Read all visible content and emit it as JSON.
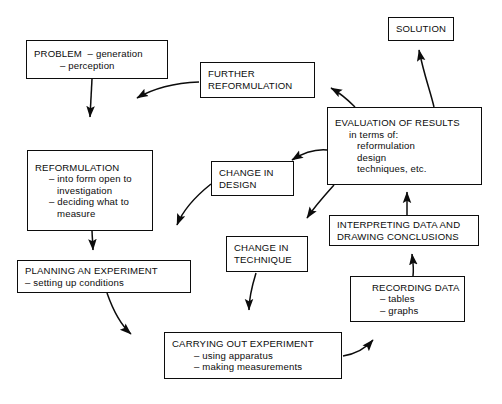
{
  "diagram": {
    "type": "flowchart-cycle",
    "background_color": "#ffffff",
    "line_color": "#0c0c0c",
    "text_color": "#0c0c0c",
    "nodes": [
      {
        "id": "problem",
        "lines": [
          "PROBLEM  – generation",
          "– perception"
        ],
        "line1": "PROBLEM  – generation",
        "line2": "– perception"
      },
      {
        "id": "reformulation",
        "line1": "REFORMULATION",
        "line2": "– into form open to",
        "line3": "investigation",
        "line4": "– deciding what to",
        "line5": "measure"
      },
      {
        "id": "planning",
        "line1": "PLANNING AN EXPERIMENT",
        "line2": "– setting up conditions"
      },
      {
        "id": "carrying-out",
        "line1": "CARRYING OUT EXPERIMENT",
        "line2": "– using apparatus",
        "line3": "– making measurements"
      },
      {
        "id": "recording",
        "line1": "RECORDING DATA",
        "line2": "– tables",
        "line3": "– graphs"
      },
      {
        "id": "interpreting",
        "line1": "INTERPRETING DATA AND",
        "line2": "DRAWING CONCLUSIONS"
      },
      {
        "id": "evaluation",
        "line1": "EVALUATION OF RESULTS",
        "line2": "in terms of:",
        "line3": "reformulation",
        "line4": "design",
        "line5": "techniques, etc."
      },
      {
        "id": "solution",
        "line1": "SOLUTION"
      },
      {
        "id": "further-reformulation",
        "line1": "FURTHER",
        "line2": "REFORMULATION"
      },
      {
        "id": "change-in-design",
        "line1": "CHANGE IN",
        "line2": "DESIGN"
      },
      {
        "id": "change-in-technique",
        "line1": "CHANGE IN",
        "line2": "TECHNIQUE"
      }
    ],
    "edges": [
      {
        "from": "problem",
        "to": "reformulation",
        "style": "straight"
      },
      {
        "from": "reformulation",
        "to": "planning",
        "style": "straight"
      },
      {
        "from": "planning",
        "to": "carrying-out",
        "style": "curved"
      },
      {
        "from": "carrying-out",
        "to": "recording",
        "style": "curved"
      },
      {
        "from": "recording",
        "to": "interpreting",
        "style": "curved"
      },
      {
        "from": "interpreting",
        "to": "evaluation",
        "style": "straight"
      },
      {
        "from": "evaluation",
        "to": "solution",
        "style": "curved"
      },
      {
        "from": "evaluation",
        "to": "further-reformulation",
        "style": "curved"
      },
      {
        "from": "further-reformulation",
        "to": "reformulation",
        "style": "curved"
      },
      {
        "from": "evaluation",
        "to": "change-in-design",
        "style": "curved"
      },
      {
        "from": "change-in-design",
        "to": "planning",
        "style": "curved"
      },
      {
        "from": "evaluation",
        "to": "change-in-technique",
        "style": "curved"
      },
      {
        "from": "change-in-technique",
        "to": "carrying-out",
        "style": "curved"
      }
    ]
  }
}
